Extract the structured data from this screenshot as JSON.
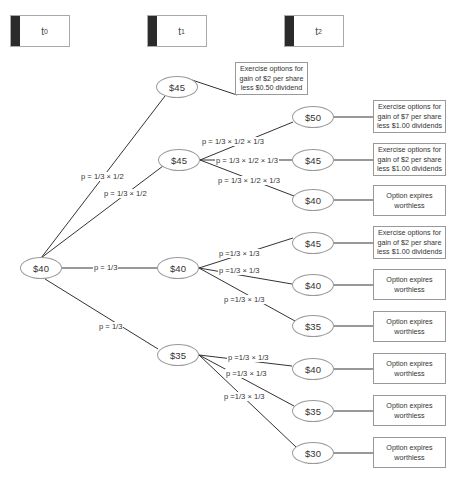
{
  "timeline": [
    {
      "label": "t",
      "sub": "0"
    },
    {
      "label": "t",
      "sub": "1"
    },
    {
      "label": "t",
      "sub": "2"
    }
  ],
  "colors": {
    "line": "#333333",
    "border": "#999999",
    "timeline_bar": "#2b2b2b"
  },
  "nodes": {
    "root": "$40",
    "t1_up_a": "$45",
    "t1_up_b": "$45",
    "t1_mid": "$40",
    "t1_down": "$35",
    "t2_a": "$50",
    "t2_b": "$45",
    "t2_c": "$40",
    "t2_d": "$45",
    "t2_e": "$40",
    "t2_f": "$35",
    "t2_g": "$40",
    "t2_h": "$35",
    "t2_i": "$30"
  },
  "outcomes": {
    "t1_up_a": "Exercise options for gain of $2 per share less $0.50 dividend",
    "t2_a": "Exercise options for gain of $7 per share less $1.00 dividends",
    "t2_b": "Exercise options for gain of $2 per share less $1.00 dividends",
    "t2_c": "Option expires worthless",
    "t2_d": "Exercise options for gain of $2 per share less $1.00 dividends",
    "t2_e": "Option expires worthless",
    "t2_f": "Option expires worthless",
    "t2_g": "Option expires worthless",
    "t2_h": "Option expires worthless",
    "t2_i": "Option expires worthless"
  },
  "probabilities": {
    "root_to_up_a": "p = 1/3 × 1/2",
    "root_to_up_b": "p = 1/3 × 1/2",
    "root_to_mid": "p = 1/3",
    "root_to_down": "p = 1/3",
    "up_b_to_a": "p = 1/3 × 1/2 × 1/3",
    "up_b_to_b": "p = 1/3 × 1/2 × 1/3",
    "up_b_to_c": "p = 1/3 × 1/2 × 1/3",
    "mid_to_d": "p =1/3 × 1/3",
    "mid_to_e": "p =1/3 × 1/3",
    "mid_to_f": "p =1/3 × 1/3",
    "down_to_g": "p =1/3 × 1/3",
    "down_to_h": "p =1/3 × 1/3",
    "down_to_i": "p =1/3 × 1/3"
  }
}
